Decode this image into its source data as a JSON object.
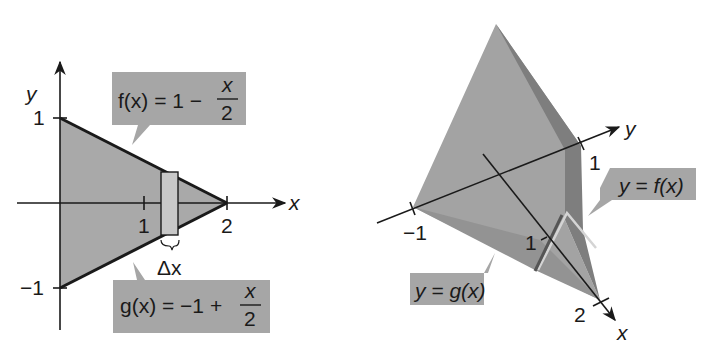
{
  "colors": {
    "background": "#ffffff",
    "region_fill": "#a9a9a9",
    "slab_fill": "#c8c8c8",
    "callout_fill": "#a6a6a6",
    "solid_front": "#a3a3a3",
    "solid_side": "#7e7e7e",
    "solid_bottom": "#939393",
    "line": "#1a1a1a",
    "slice_edge": "#d4d4d4"
  },
  "left_diagram": {
    "y_axis_label": "y",
    "x_axis_label": "x",
    "y_tick_top": "1",
    "y_tick_bottom": "−1",
    "x_tick_1": "1",
    "x_tick_2": "2",
    "delta_label": "Δx",
    "callout_f": {
      "lhs": "f(x) = 1 −",
      "num": "x",
      "den": "2"
    },
    "callout_g": {
      "lhs": "g(x) = −1 +",
      "num": "x",
      "den": "2"
    }
  },
  "right_diagram": {
    "y_axis_label": "y",
    "x_axis_label": "x",
    "y_tick_neg": "−1",
    "y_tick_pos": "1",
    "x_tick_1": "1",
    "x_tick_2": "2",
    "callout_f": "y = f(x)",
    "callout_g": "y = g(x)"
  }
}
